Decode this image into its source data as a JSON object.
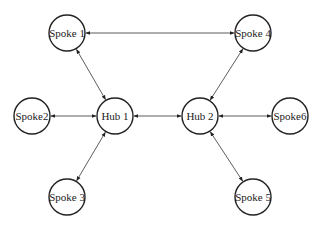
{
  "diagram": {
    "title": "",
    "nodes": [
      {
        "id": "spoke1",
        "label": "Spoke 1",
        "cx": 67,
        "cy": 33
      },
      {
        "id": "spoke4",
        "label": "Spoke 4",
        "cx": 253,
        "cy": 33
      },
      {
        "id": "spoke2",
        "label": "Spoke2",
        "cx": 32,
        "cy": 116
      },
      {
        "id": "hub1",
        "label": "Hub 1",
        "cx": 115,
        "cy": 116
      },
      {
        "id": "hub2",
        "label": "Hub 2",
        "cx": 200,
        "cy": 116
      },
      {
        "id": "spoke6",
        "label": "Spoke6",
        "cx": 290,
        "cy": 116
      },
      {
        "id": "spoke3",
        "label": "Spoke 3",
        "cx": 67,
        "cy": 197
      },
      {
        "id": "spoke5",
        "label": "Spoke 5",
        "cx": 253,
        "cy": 197
      }
    ],
    "radius": 18,
    "edges": [
      {
        "from": "spoke1",
        "to": "spoke4",
        "bidirectional": true
      },
      {
        "from": "spoke1",
        "to": "hub1",
        "bidirectional": true
      },
      {
        "from": "spoke2",
        "to": "hub1",
        "bidirectional": true
      },
      {
        "from": "spoke3",
        "to": "hub1",
        "bidirectional": true
      },
      {
        "from": "hub1",
        "to": "hub2",
        "bidirectional": true
      },
      {
        "from": "spoke4",
        "to": "hub2",
        "bidirectional": true
      },
      {
        "from": "spoke6",
        "to": "hub2",
        "bidirectional": true
      },
      {
        "from": "spoke5",
        "to": "hub2",
        "bidirectional": true
      }
    ]
  }
}
